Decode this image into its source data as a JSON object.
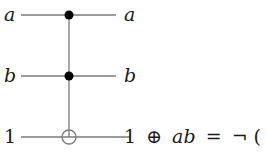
{
  "diagram": {
    "type": "quantum-circuit",
    "gate": "Toffoli",
    "wires": [
      {
        "input_label": "a",
        "output_label": "a",
        "role": "control"
      },
      {
        "input_label": "b",
        "output_label": "b",
        "role": "control"
      },
      {
        "input_label": "1",
        "output_label": "1 ⊕ ab = ¬(ab)",
        "role": "target"
      }
    ],
    "output_parts": {
      "one": "1",
      "oplus": "⊕",
      "ab": "ab",
      "eq": "=",
      "neg": "¬",
      "paren_open": "(",
      "ab2": "ab",
      "paren_close": ")"
    },
    "colors": {
      "wire": "#7a7a7a",
      "control_dot": "#000000",
      "text": "#1a1a1a"
    }
  }
}
